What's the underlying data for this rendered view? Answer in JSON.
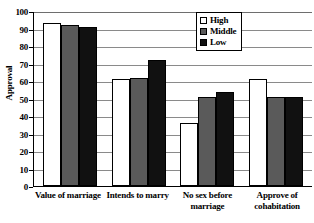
{
  "chart_data": {
    "type": "bar",
    "title": "",
    "xlabel": "",
    "ylabel": "Approval",
    "ylim": [
      0,
      100
    ],
    "ytick_step": 10,
    "yticks": [
      100,
      90,
      80,
      70,
      60,
      50,
      40,
      30,
      20,
      10,
      0
    ],
    "grid": true,
    "grid_axis": "y",
    "legend_position": "top-right",
    "categories": [
      "Value of marriage",
      "Intends to marry",
      "No sex before marriage",
      "Approve of cohabitation"
    ],
    "series": [
      {
        "name": "High",
        "color": "#ffffff",
        "values": [
          93,
          61,
          36,
          61
        ]
      },
      {
        "name": "Middle",
        "color": "#5a5a5a",
        "values": [
          92,
          62,
          51,
          51
        ]
      },
      {
        "name": "Low",
        "color": "#111111",
        "values": [
          91,
          72,
          54,
          51
        ]
      }
    ]
  },
  "legend": {
    "items": [
      {
        "label": "High",
        "swatch": "white-square-icon"
      },
      {
        "label": "Middle",
        "swatch": "gray-square-icon"
      },
      {
        "label": "Low",
        "swatch": "black-square-icon"
      }
    ]
  }
}
